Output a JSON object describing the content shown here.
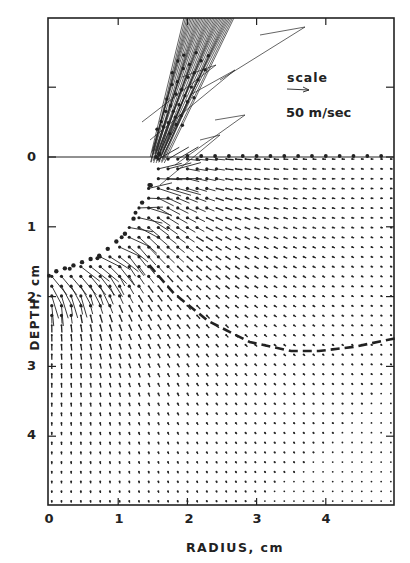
{
  "chart_data": {
    "type": "vector-field",
    "title": "",
    "xlabel": "RADIUS, cm",
    "ylabel": "DEPTH, cm",
    "x_ticks": [
      0,
      1,
      2,
      3,
      4
    ],
    "x_tick_labels": [
      "0",
      "1",
      "2",
      "3",
      "4"
    ],
    "y_ticks": [
      -2,
      -1,
      0,
      1,
      2,
      3,
      4
    ],
    "y_tick_labels": [
      "",
      "",
      "0",
      "1",
      "2",
      "3",
      "4"
    ],
    "xlim": [
      0,
      5.0
    ],
    "ylim": [
      -2.0,
      5.0
    ],
    "y_inverted": true,
    "grid": false,
    "legend": {
      "label": "scale",
      "value": "50 m/sec",
      "arrow_length_cm": 0.35
    },
    "surface_line_depth": 0,
    "crater_boundary": [
      [
        1.55,
        0.0
      ],
      [
        1.45,
        0.4
      ],
      [
        1.25,
        0.8
      ],
      [
        1.05,
        1.15
      ],
      [
        0.7,
        1.45
      ],
      [
        0.3,
        1.6
      ],
      [
        0.0,
        1.7
      ]
    ],
    "transient_crater_dashed": [
      [
        1.45,
        1.55
      ],
      [
        1.8,
        1.95
      ],
      [
        2.3,
        2.35
      ],
      [
        2.9,
        2.65
      ],
      [
        3.5,
        2.78
      ],
      [
        3.9,
        2.78
      ],
      [
        4.4,
        2.72
      ],
      [
        5.0,
        2.6
      ]
    ],
    "ejecta_curtain": {
      "base": [
        1.55,
        0.0
      ],
      "top": [
        2.6,
        -2.0
      ]
    },
    "grid_spacing_cm": {
      "dx": 0.14,
      "dy": 0.14
    },
    "annotations": [
      "scale",
      "50 m/sec"
    ]
  },
  "axes": {
    "y_tick_labels": [
      "0",
      "1",
      "2",
      "3",
      "4"
    ],
    "x_tick_labels": [
      "0",
      "1",
      "2",
      "3",
      "4"
    ],
    "xlabel": "RADIUS, cm",
    "ylabel": "DEPTH, cm"
  },
  "legend": {
    "label": "scale",
    "value": "50 m/sec"
  },
  "colors": {
    "ink": "#222222",
    "background": "#ffffff"
  }
}
